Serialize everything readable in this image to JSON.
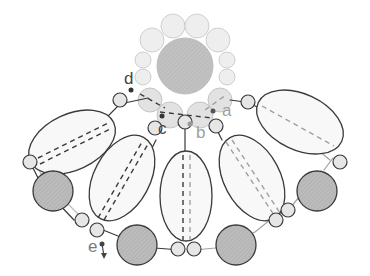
{
  "diagram": {
    "type": "beading-pattern",
    "labels": {
      "a": "a",
      "b": "b",
      "c": "c",
      "d": "d",
      "e": "e"
    },
    "colors": {
      "outline": "#3a3a3a",
      "light_bead_fill": "#ececec",
      "ring_bead_fill": "#e3e3e3",
      "ring_bead_stroke": "#c8c8c8",
      "dark_bead_fill": "#bdbdbd",
      "center_bead_fill": "#c6c6c6",
      "oval_fill": "#f7f7f7",
      "thread_dark": "#3a3a3a",
      "thread_light": "#9c9c9c",
      "label_dark": "#444444",
      "label_light": "#a0a0a0"
    }
  }
}
